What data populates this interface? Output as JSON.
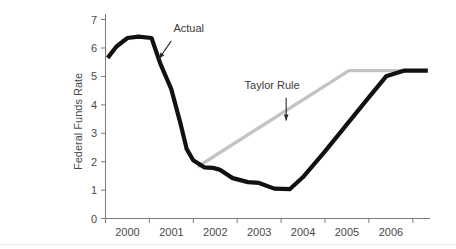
{
  "caption_fragment": "r",
  "chart_data": {
    "type": "line",
    "title": "",
    "xlabel": "",
    "ylabel": "Federal Funds Rate",
    "xlim": [
      1999.5,
      2006.9
    ],
    "ylim": [
      0,
      7
    ],
    "yticks": [
      0,
      1,
      2,
      3,
      4,
      5,
      6,
      7
    ],
    "ytick_labels": [
      "0",
      "1",
      "2",
      "3",
      "4",
      "5",
      "6",
      "7"
    ],
    "xticks": [
      1999.5,
      2000.5,
      2001.5,
      2002.5,
      2003.5,
      2004.5,
      2005.5,
      2006.5
    ],
    "xtick_labels": [
      "2000",
      "2001",
      "2002",
      "2003",
      "2004",
      "2005",
      "2006"
    ],
    "grid": false,
    "legend_position": "inline-annotations",
    "series": [
      {
        "name": "Actual",
        "color": "#111111",
        "x": [
          1999.55,
          1999.75,
          2000.0,
          2000.25,
          2000.55,
          2000.75,
          2001.0,
          2001.2,
          2001.35,
          2001.5,
          2001.75,
          2001.95,
          2002.1,
          2002.4,
          2002.75,
          2003.0,
          2003.35,
          2003.7,
          2004.0,
          2004.5,
          2005.0,
          2005.5,
          2005.9,
          2006.3,
          2006.85
        ],
        "values": [
          5.65,
          6.05,
          6.35,
          6.4,
          6.35,
          5.45,
          4.55,
          3.4,
          2.45,
          2.05,
          1.8,
          1.78,
          1.72,
          1.42,
          1.28,
          1.25,
          1.05,
          1.03,
          1.45,
          2.35,
          3.3,
          4.25,
          5.0,
          5.2,
          5.2
        ]
      },
      {
        "name": "Taylor Rule",
        "color": "#c4c4c4",
        "x": [
          2001.6,
          2005.05,
          2006.85
        ],
        "values": [
          1.82,
          5.2,
          5.2
        ]
      }
    ],
    "annotations": [
      {
        "label": "Actual",
        "label_x": 2001.05,
        "label_y": 6.55,
        "arrow_from_x": 2001.0,
        "arrow_from_y": 6.25,
        "arrow_to_x": 2000.72,
        "arrow_to_y": 5.62
      },
      {
        "label": "Taylor Rule",
        "label_x": 2003.3,
        "label_y": 4.55,
        "arrow_from_x": 2003.62,
        "arrow_from_y": 4.25,
        "arrow_to_x": 2003.62,
        "arrow_to_y": 3.45
      }
    ]
  }
}
